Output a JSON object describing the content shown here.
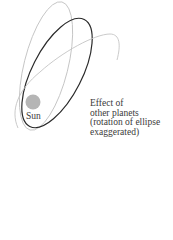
{
  "diagram": {
    "sun_label": "Sun",
    "caption_lines": [
      "Effect of",
      "other planets",
      "(rotation of ellipse",
      "exaggerated)"
    ],
    "colors": {
      "current_orbit": "#2a2a2a",
      "other_orbits": "#bdbdbd",
      "sun_fill": "#b5b5b5",
      "text": "#3a3a3a"
    },
    "elements": [
      {
        "type": "ellipse",
        "role": "orbit-rotated-left",
        "style": "light-gray"
      },
      {
        "type": "ellipse",
        "role": "orbit-current",
        "style": "dark"
      },
      {
        "type": "arc",
        "role": "orbit-rotated-right",
        "style": "light-gray"
      },
      {
        "type": "circle",
        "role": "sun"
      }
    ]
  }
}
